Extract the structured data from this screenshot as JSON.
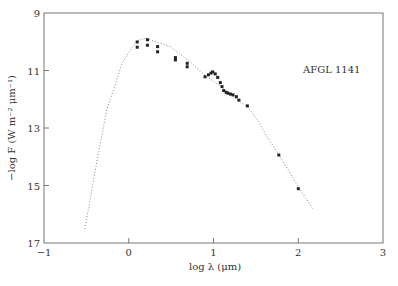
{
  "chart_data": {
    "type": "scatter",
    "title": "",
    "annotation": "AFGL 1141",
    "xlabel": "log λ (μm)",
    "ylabel": "−log F (W m⁻² μm⁻¹)",
    "xlim": [
      -1,
      3
    ],
    "ylim": [
      9,
      17
    ],
    "y_inverted": true,
    "xticks": [
      -1,
      0,
      1,
      2,
      3
    ],
    "yticks": [
      9,
      11,
      13,
      15,
      17
    ],
    "grid": false,
    "legend": null,
    "series": [
      {
        "name": "observed",
        "style": "markers",
        "color": "#222222",
        "points": [
          [
            0.1,
            10.01
          ],
          [
            0.1,
            10.19
          ],
          [
            0.22,
            9.93
          ],
          [
            0.22,
            10.12
          ],
          [
            0.34,
            10.17
          ],
          [
            0.34,
            10.35
          ],
          [
            0.55,
            10.55
          ],
          [
            0.55,
            10.63
          ],
          [
            0.69,
            10.75
          ],
          [
            0.69,
            10.87
          ],
          [
            0.9,
            11.22
          ],
          [
            0.94,
            11.15
          ],
          [
            0.97,
            11.09
          ],
          [
            0.99,
            11.05
          ],
          [
            1.02,
            11.12
          ],
          [
            1.05,
            11.24
          ],
          [
            1.08,
            11.42
          ],
          [
            1.1,
            11.56
          ],
          [
            1.12,
            11.7
          ],
          [
            1.15,
            11.76
          ],
          [
            1.17,
            11.79
          ],
          [
            1.2,
            11.82
          ],
          [
            1.23,
            11.85
          ],
          [
            1.27,
            11.91
          ],
          [
            1.3,
            12.03
          ],
          [
            1.4,
            12.23
          ],
          [
            1.77,
            13.94
          ],
          [
            2.0,
            15.11
          ]
        ]
      },
      {
        "name": "model",
        "style": "dotted-line",
        "color": "#888888",
        "points": [
          [
            -0.52,
            16.51
          ],
          [
            -0.47,
            15.74
          ],
          [
            -0.4,
            14.55
          ],
          [
            -0.32,
            13.3
          ],
          [
            -0.26,
            12.37
          ],
          [
            -0.18,
            11.68
          ],
          [
            -0.08,
            10.75
          ],
          [
            0.02,
            10.29
          ],
          [
            0.1,
            9.96
          ],
          [
            0.2,
            9.88
          ],
          [
            0.3,
            9.98
          ],
          [
            0.49,
            10.17
          ],
          [
            0.72,
            10.69
          ],
          [
            0.9,
            11.16
          ],
          [
            1.1,
            11.6
          ],
          [
            1.31,
            12.09
          ],
          [
            1.4,
            12.25
          ],
          [
            1.53,
            12.78
          ],
          [
            1.63,
            13.3
          ],
          [
            1.77,
            13.92
          ],
          [
            2.0,
            15.05
          ],
          [
            2.18,
            15.85
          ]
        ]
      }
    ]
  },
  "layout": {
    "plot_left": 44,
    "plot_top": 13,
    "plot_right": 383,
    "plot_bottom": 243,
    "frame_color": "#777777"
  }
}
